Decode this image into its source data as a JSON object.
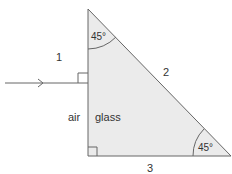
{
  "diagram": {
    "title": "",
    "labels": {
      "face_1": "1",
      "face_2": "2",
      "face_3": "3",
      "medium_left": "air",
      "medium_right": "glass",
      "angle_top": "45°",
      "angle_bottom_right": "45°"
    },
    "colors": {
      "prism_fill": "#ebebeb",
      "stroke": "#555555",
      "text": "#333333"
    }
  }
}
